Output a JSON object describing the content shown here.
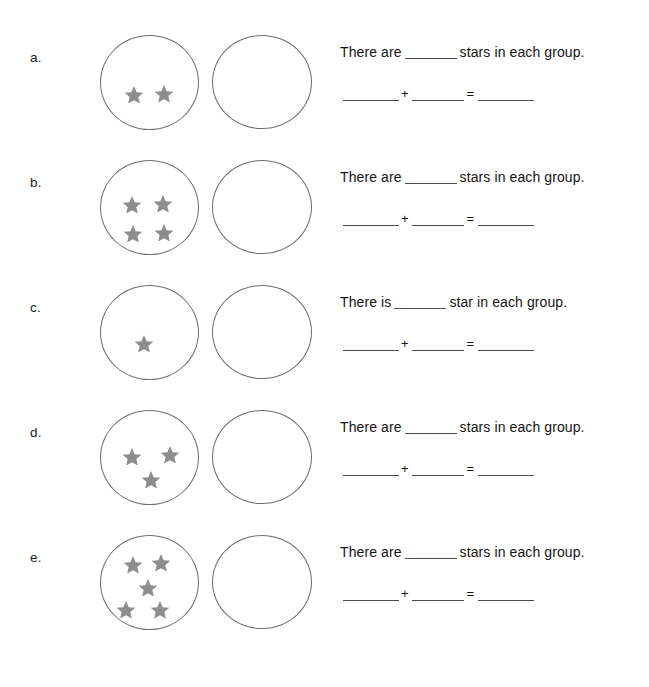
{
  "worksheet": {
    "title": "Stars in each group addition worksheet",
    "star_color": "#8d8d8d",
    "oval_stroke_color": "#6e6e6e",
    "blank_placeholder": "",
    "operators": {
      "plus": "+",
      "equals": "="
    },
    "rows": [
      {
        "label": "a.",
        "left_group_star_count": 2,
        "right_group_star_count": 0,
        "star_positions": [
          {
            "x": 22,
            "y": 48
          },
          {
            "x": 52,
            "y": 47
          }
        ],
        "sentence_before": "There are",
        "sentence_after": "stars in each group."
      },
      {
        "label": "b.",
        "left_group_star_count": 4,
        "right_group_star_count": 0,
        "star_positions": [
          {
            "x": 20,
            "y": 33
          },
          {
            "x": 51,
            "y": 32
          },
          {
            "x": 21,
            "y": 62
          },
          {
            "x": 52,
            "y": 61
          }
        ],
        "sentence_before": "There are",
        "sentence_after": "stars in each group."
      },
      {
        "label": "c.",
        "left_group_star_count": 1,
        "right_group_star_count": 0,
        "star_positions": [
          {
            "x": 32,
            "y": 47
          }
        ],
        "sentence_before": "There is",
        "sentence_after": "star in each group."
      },
      {
        "label": "d.",
        "left_group_star_count": 3,
        "right_group_star_count": 0,
        "star_positions": [
          {
            "x": 20,
            "y": 35
          },
          {
            "x": 58,
            "y": 33
          },
          {
            "x": 39,
            "y": 58
          }
        ],
        "sentence_before": "There are",
        "sentence_after": "stars in each group."
      },
      {
        "label": "e.",
        "left_group_star_count": 5,
        "right_group_star_count": 0,
        "star_positions": [
          {
            "x": 21,
            "y": 18
          },
          {
            "x": 49,
            "y": 16
          },
          {
            "x": 36,
            "y": 41
          },
          {
            "x": 14,
            "y": 63
          },
          {
            "x": 48,
            "y": 63
          }
        ],
        "sentence_before": "There are",
        "sentence_after": "stars in each group."
      }
    ]
  }
}
